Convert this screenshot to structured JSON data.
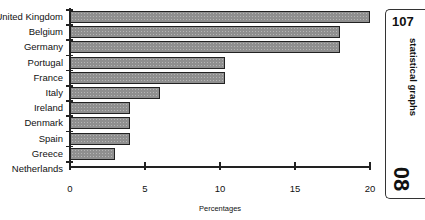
{
  "chart_data": {
    "type": "bar",
    "orientation": "horizontal",
    "title": "",
    "xlabel": "Percentages",
    "ylabel": "",
    "categories": [
      "United Kingdom",
      "Belgium",
      "Germany",
      "Portugal",
      "France",
      "Italy",
      "Ireland",
      "Denmark",
      "Spain",
      "Greece",
      "Netherlands"
    ],
    "values": [
      20,
      18,
      18,
      10.3,
      10.3,
      6,
      4,
      4,
      4,
      3,
      0
    ],
    "xlim": [
      0,
      20
    ],
    "xticks": [
      "0",
      "5",
      "10",
      "15",
      "20"
    ],
    "grid": false,
    "legend": null
  },
  "side_tab": {
    "page_number": "107",
    "section_label": "statistical graphs",
    "chapter_number": "08"
  }
}
